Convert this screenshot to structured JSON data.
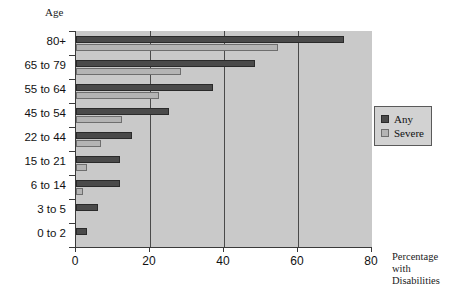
{
  "chart_data": {
    "type": "bar",
    "orientation": "horizontal",
    "title": "",
    "xlabel": "Percentage with Disabilities",
    "ylabel": "Age",
    "categories": [
      "80+",
      "65 to 79",
      "55 to 64",
      "45 to 54",
      "22 to 44",
      "15 to 21",
      "6 to 14",
      "3 to 5",
      "0 to 2"
    ],
    "series": [
      {
        "name": "Any",
        "values": [
          72.5,
          48.5,
          37,
          25,
          15,
          12,
          12,
          6,
          3
        ]
      },
      {
        "name": "Severe",
        "values": [
          54.5,
          28.5,
          22.5,
          12.5,
          6.7,
          3,
          2,
          0,
          0
        ]
      }
    ],
    "xlim": [
      0,
      80
    ],
    "xticks": [
      0,
      20,
      40,
      60,
      80
    ],
    "xtick_labels": [
      "0",
      "20",
      "40",
      "60",
      "80"
    ],
    "grid": true,
    "gridlines_at": [
      20,
      40,
      60
    ],
    "legend_position": "right",
    "colors": {
      "any": "#4a4a4a",
      "severe": "#b4b4b4",
      "plot_background": "#c9c9c9",
      "axis": "#3a3a3a",
      "legend_background": "#d2d2d2"
    }
  },
  "axis_titles": {
    "y_title": "Age",
    "x_caption_line1": "Percentage",
    "x_caption_line2": "with",
    "x_caption_line3": "Disabilities"
  },
  "legend": {
    "items": [
      {
        "label": "Any",
        "key": "any"
      },
      {
        "label": "Severe",
        "key": "severe"
      }
    ]
  }
}
